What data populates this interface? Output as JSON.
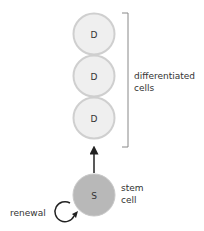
{
  "diagram": {
    "differentiated_cells": [
      {
        "letter": "D"
      },
      {
        "letter": "D"
      },
      {
        "letter": "D"
      }
    ],
    "stem_cell": {
      "letter": "S"
    },
    "labels": {
      "differentiated_line1": "differentiated",
      "differentiated_line2": "cells",
      "stem_line1": "stem",
      "stem_line2": "cell",
      "renewal": "renewal"
    },
    "colors": {
      "d_fill": "#efefef",
      "d_stroke": "#cfcfcf",
      "s_fill": "#b8b8b8",
      "s_stroke": "#c8c8c8",
      "arrow": "#222222",
      "bracket": "#888888",
      "text": "#333333"
    }
  }
}
